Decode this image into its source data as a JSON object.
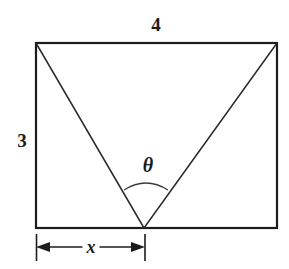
{
  "figure": {
    "type": "geometry-diagram",
    "background_color": "#ffffff",
    "stroke_color": "#1c1c1c",
    "labels": {
      "top_width": "4",
      "left_height": "3",
      "angle": "θ",
      "base_segment": "x"
    },
    "geometry": {
      "rectangle": {
        "left": 36,
        "top": 43,
        "right": 277,
        "bottom": 228,
        "width_label": "4",
        "height_label": "3",
        "border_width_px": 2
      },
      "apex": {
        "x": 144,
        "y": 228
      },
      "diagonals": [
        {
          "name": "left-diagonal",
          "x1": 36,
          "y1": 43,
          "x2": 144,
          "y2": 228
        },
        {
          "name": "right-diagonal",
          "x1": 277,
          "y1": 43,
          "x2": 144,
          "y2": 228
        }
      ],
      "angle_arc": {
        "start_x": 124,
        "start_y": 190,
        "peak_y": 181,
        "end_x": 168,
        "end_y": 190
      },
      "dimension_line": {
        "y": 247,
        "from_x": 36,
        "to_x": 145,
        "tick_top": 234,
        "tick_bottom": 261,
        "label": "x"
      }
    }
  }
}
